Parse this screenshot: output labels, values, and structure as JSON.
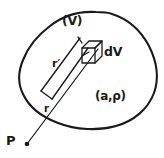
{
  "figure": {
    "background_color": "#ffffff",
    "ink_color": "#1a1a1a",
    "width": 164,
    "height": 158
  },
  "labels": {
    "volume_region": "(V)",
    "volume_element": "dV",
    "material_properties": "(a,ρ)",
    "field_point": "P",
    "vector_source": "r′",
    "vector_distance": "r"
  },
  "geometry": {
    "blob_path": "M 96 12 C 72 11, 52 20, 38 36 C 24 52, 18 70, 22 88 C 26 106, 40 118, 58 124 C 78 131, 102 131, 122 124 C 140 118, 152 104, 155 86 C 158 66, 152 44, 138 28 C 126 15, 112 12, 96 12 Z",
    "ray_from_p": "M 26 145 L 98 48",
    "strip_edge_left": "M 40 92 L 80 37",
    "strip_edge_right": "M 53 99 L 91 45",
    "strip_cap": "M 40 92 L 53 99",
    "cube_front_face": "M 82 47 L 96 47 L 96 63 L 82 63 Z",
    "cube_top_face": "M 82 47 L 89 41 L 103 41 L 96 47 Z",
    "cube_side_face": "M 96 47 L 103 41 L 103 57 L 96 63 Z",
    "point_p_dot": {
      "cx": 26,
      "cy": 145,
      "r": 2.2
    }
  },
  "elements": [
    {
      "name": "volume-boundary",
      "kind": "closed-curve"
    },
    {
      "name": "volume-element-cube",
      "kind": "parallelepiped"
    },
    {
      "name": "source-vector-strip",
      "kind": "narrow-quadrilateral"
    },
    {
      "name": "distance-ray",
      "kind": "line-segment"
    },
    {
      "name": "field-point-marker",
      "kind": "dot"
    }
  ]
}
